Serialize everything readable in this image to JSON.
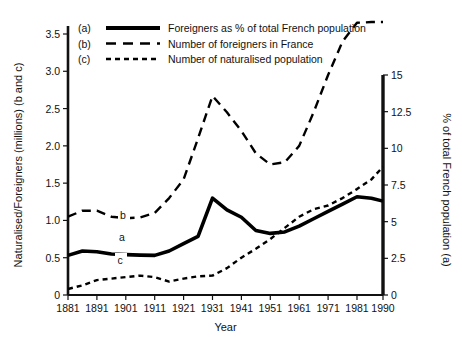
{
  "chart_data": {
    "type": "line",
    "title": "",
    "xlabel": "Year",
    "ylabel": "Naturalised/Foreigners (millions) (b and c)",
    "y2label": "% of total French population (a)",
    "x": [
      1881,
      1891,
      1901,
      1911,
      1921,
      1931,
      1941,
      1951,
      1961,
      1971,
      1981,
      1990
    ],
    "xticklabels": [
      "1881",
      "1891",
      "1901",
      "1911",
      "1921",
      "1931",
      "1941",
      "1951",
      "1961",
      "1971",
      "1981",
      "1990"
    ],
    "xlim": [
      1881,
      1990
    ],
    "ylim": [
      0,
      3.75
    ],
    "yticks": [
      0,
      0.5,
      1.0,
      1.5,
      2.0,
      2.5,
      3.0,
      3.5
    ],
    "yticklabels": [
      "0",
      "0.5",
      "1.0",
      "1.5",
      "2.0",
      "2.5",
      "3.0",
      "3.5"
    ],
    "y2lim": [
      0,
      15
    ],
    "y2ticks": [
      0,
      2.5,
      5,
      7.5,
      10,
      12.5,
      15
    ],
    "y2ticklabels": [
      "0",
      "2.5",
      "5",
      "7.5",
      "10",
      "12.5",
      "15"
    ],
    "grid": false,
    "legend_position": "top-left",
    "series": [
      {
        "key": "a",
        "name": "Foreigners as % of total French population",
        "axis": "right",
        "style": "solid",
        "inline_label": "a",
        "x": [
          1881,
          1886,
          1891,
          1896,
          1901,
          1906,
          1911,
          1916,
          1921,
          1926,
          1931,
          1936,
          1941,
          1946,
          1951,
          1956,
          1961,
          1966,
          1971,
          1976,
          1981,
          1986,
          1990
        ],
        "values": [
          2.7,
          3.0,
          2.95,
          2.8,
          2.75,
          2.72,
          2.7,
          3.0,
          3.5,
          4.0,
          6.6,
          5.8,
          5.3,
          4.4,
          4.2,
          4.3,
          4.7,
          5.2,
          5.7,
          6.2,
          6.7,
          6.6,
          6.4
        ]
      },
      {
        "key": "b",
        "name": "Number of foreigners in France",
        "axis": "left",
        "style": "long-dash",
        "inline_label": "b",
        "x": [
          1881,
          1886,
          1891,
          1896,
          1901,
          1906,
          1911,
          1916,
          1921,
          1926,
          1931,
          1936,
          1941,
          1946,
          1951,
          1956,
          1961,
          1966,
          1971,
          1976,
          1981,
          1986,
          1990
        ],
        "values": [
          1.05,
          1.13,
          1.13,
          1.05,
          1.03,
          1.04,
          1.1,
          1.3,
          1.55,
          2.1,
          2.67,
          2.45,
          2.2,
          1.9,
          1.75,
          1.78,
          2.0,
          2.45,
          2.95,
          3.4,
          3.65,
          3.66,
          3.66
        ]
      },
      {
        "key": "c",
        "name": "Number of naturalised population",
        "axis": "left",
        "style": "short-dash",
        "inline_label": "c",
        "x": [
          1881,
          1886,
          1891,
          1896,
          1901,
          1906,
          1911,
          1916,
          1921,
          1926,
          1931,
          1936,
          1941,
          1946,
          1951,
          1956,
          1961,
          1966,
          1971,
          1976,
          1981,
          1986,
          1990
        ],
        "values": [
          0.08,
          0.13,
          0.2,
          0.22,
          0.24,
          0.26,
          0.24,
          0.18,
          0.22,
          0.25,
          0.26,
          0.36,
          0.5,
          0.62,
          0.75,
          0.9,
          1.05,
          1.15,
          1.2,
          1.3,
          1.42,
          1.55,
          1.72
        ]
      }
    ]
  },
  "legend": {
    "entries": [
      {
        "key": "(a)",
        "label": "Foreigners as % of total French population",
        "style": "solid"
      },
      {
        "key": "(b)",
        "label": "Number of foreigners in France",
        "style": "long-dash"
      },
      {
        "key": "(c)",
        "label": "Number of naturalised population",
        "style": "short-dash"
      }
    ]
  },
  "inline_labels": [
    {
      "text": "a",
      "x": 122,
      "y": 241
    },
    {
      "text": "b",
      "x": 123,
      "y": 219
    },
    {
      "text": "c",
      "x": 120,
      "y": 264
    }
  ]
}
